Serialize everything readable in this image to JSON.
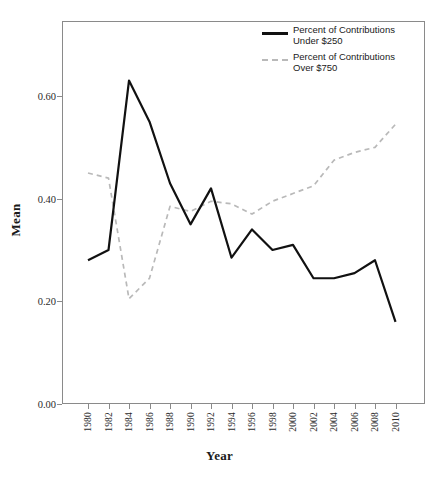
{
  "figure": {
    "y_axis_title": "Mean",
    "x_axis_title": "Year",
    "caption": ""
  },
  "legend": {
    "position": "top-right",
    "items": [
      {
        "label_line1": "Percent of Contributions",
        "label_line2": "Under $250",
        "style": "solid",
        "color": "#111111"
      },
      {
        "label_line1": "Percent of Contributions",
        "label_line2": "Over $750",
        "style": "dashed",
        "color": "#b9b9b9"
      }
    ]
  },
  "axes": {
    "y_ticks": [
      "0.00",
      "0.20",
      "0.40",
      "0.60"
    ],
    "y_tick_values": [
      0.0,
      0.2,
      0.4,
      0.6
    ],
    "x_ticks": [
      "1980",
      "1982",
      "1984",
      "1986",
      "1988",
      "1990",
      "1992",
      "1994",
      "1996",
      "1998",
      "2000",
      "2002",
      "2004",
      "2006",
      "2008",
      "2010"
    ]
  },
  "chart_data": {
    "type": "line",
    "title": "",
    "xlabel": "Year",
    "ylabel": "Mean",
    "xlim": [
      1980,
      2010
    ],
    "ylim": [
      0.0,
      0.72
    ],
    "grid": false,
    "legend_position": "top-right",
    "x": [
      1980,
      1982,
      1984,
      1986,
      1988,
      1990,
      1992,
      1994,
      1996,
      1998,
      2000,
      2002,
      2004,
      2006,
      2008,
      2010
    ],
    "series": [
      {
        "name": "Percent of Contributions Under $250",
        "style": "solid",
        "color": "#111111",
        "values": [
          0.28,
          0.3,
          0.63,
          0.55,
          0.43,
          0.35,
          0.42,
          0.285,
          0.34,
          0.3,
          0.31,
          0.245,
          0.245,
          0.255,
          0.28,
          0.16
        ]
      },
      {
        "name": "Percent of Contributions Over $750",
        "style": "dashed",
        "color": "#b9b9b9",
        "values": [
          0.45,
          0.44,
          0.205,
          0.245,
          0.385,
          0.375,
          0.395,
          0.39,
          0.37,
          0.395,
          0.41,
          0.425,
          0.475,
          0.49,
          0.5,
          0.545
        ]
      }
    ]
  }
}
